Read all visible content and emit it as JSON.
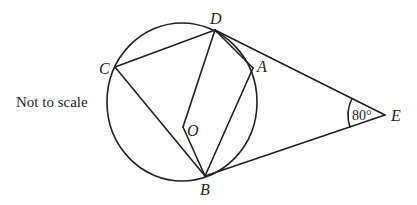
{
  "diagram": {
    "note": "Not to scale",
    "angle_label": "80°",
    "points": {
      "A": {
        "label": "A",
        "x": 253,
        "y": 68
      },
      "B": {
        "label": "B",
        "x": 205,
        "y": 176
      },
      "C": {
        "label": "C",
        "x": 115,
        "y": 67
      },
      "D": {
        "label": "D",
        "x": 215,
        "y": 30
      },
      "E": {
        "label": "E",
        "x": 385,
        "y": 115
      },
      "O": {
        "label": "O",
        "x": 183,
        "y": 127
      }
    },
    "segments": [
      "DC",
      "CB",
      "DO",
      "OB",
      "DA",
      "AB",
      "DE",
      "BE"
    ],
    "circle": {
      "center": "O",
      "passes_through": [
        "A",
        "B",
        "C",
        "D"
      ]
    },
    "tangents": [
      "ED",
      "EB"
    ],
    "given_angle": {
      "vertex": "E",
      "between": [
        "D",
        "B"
      ],
      "value": "80°"
    }
  }
}
